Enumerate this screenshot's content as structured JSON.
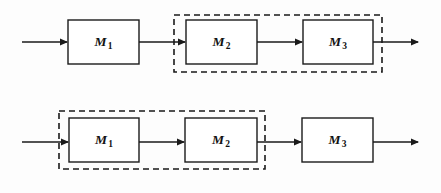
{
  "diagram": {
    "canvas": {
      "width": 441,
      "height": 193,
      "background": "#fdfdfd"
    },
    "stroke_color": "#1a1a1a",
    "block_fill": "#ffffff",
    "rows": [
      {
        "id": "row-top",
        "name": "top-configuration",
        "blocks": [
          {
            "id": "top-m1",
            "label": "M",
            "subscript": "1",
            "x": 68,
            "y": 20,
            "w": 71,
            "h": 44
          },
          {
            "id": "top-m2",
            "label": "M",
            "subscript": "2",
            "x": 186,
            "y": 20,
            "w": 71,
            "h": 44
          },
          {
            "id": "top-m3",
            "label": "M",
            "subscript": "3",
            "x": 303,
            "y": 20,
            "w": 70,
            "h": 44
          }
        ],
        "group": {
          "id": "top-group",
          "name": "dashed-group-m2-m3",
          "x": 174,
          "y": 15,
          "w": 208,
          "h": 57
        },
        "arrows": [
          {
            "id": "top-arrow-in",
            "name": "input-arrow",
            "x1": 22,
            "y1": 42,
            "x2": 68,
            "y2": 42
          },
          {
            "id": "top-arrow-12",
            "name": "arrow-m1-to-m2",
            "x1": 139,
            "y1": 42,
            "x2": 186,
            "y2": 42
          },
          {
            "id": "top-arrow-23",
            "name": "arrow-m2-to-m3",
            "x1": 257,
            "y1": 42,
            "x2": 303,
            "y2": 42
          },
          {
            "id": "top-arrow-out",
            "name": "output-arrow",
            "x1": 373,
            "y1": 42,
            "x2": 419,
            "y2": 42
          }
        ]
      },
      {
        "id": "row-bottom",
        "name": "bottom-configuration",
        "blocks": [
          {
            "id": "bot-m1",
            "label": "M",
            "subscript": "1",
            "x": 69,
            "y": 118,
            "w": 70,
            "h": 44
          },
          {
            "id": "bot-m2",
            "label": "M",
            "subscript": "2",
            "x": 185,
            "y": 118,
            "w": 72,
            "h": 44
          },
          {
            "id": "bot-m3",
            "label": "M",
            "subscript": "3",
            "x": 302,
            "y": 118,
            "w": 71,
            "h": 44
          }
        ],
        "group": {
          "id": "bot-group",
          "name": "dashed-group-m1-m2",
          "x": 59,
          "y": 111,
          "w": 206,
          "h": 58
        },
        "arrows": [
          {
            "id": "bot-arrow-in",
            "name": "input-arrow",
            "x1": 22,
            "y1": 142,
            "x2": 69,
            "y2": 142
          },
          {
            "id": "bot-arrow-12",
            "name": "arrow-m1-to-m2",
            "x1": 139,
            "y1": 142,
            "x2": 185,
            "y2": 142
          },
          {
            "id": "bot-arrow-23",
            "name": "arrow-m2-to-m3",
            "x1": 257,
            "y1": 142,
            "x2": 302,
            "y2": 142
          },
          {
            "id": "bot-arrow-out",
            "name": "output-arrow",
            "x1": 373,
            "y1": 142,
            "x2": 419,
            "y2": 142
          }
        ]
      }
    ]
  }
}
